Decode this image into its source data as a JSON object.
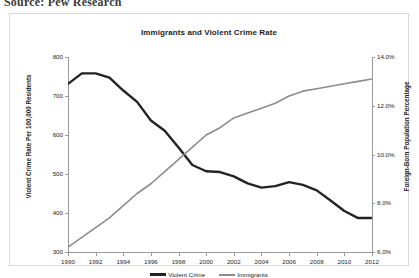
{
  "source_caption": "Source: Pew Research",
  "chart_data": {
    "type": "line",
    "title": "Immigrants and Violent Crime Rate",
    "xlabel": "",
    "ylabel": "Violent Crime Rate Per 100,000 Residents",
    "y2label": "Foreign-Born Population Percentage",
    "grid": false,
    "legend_position": "bottom",
    "x": [
      1990,
      1991,
      1992,
      1993,
      1994,
      1995,
      1996,
      1997,
      1998,
      1999,
      2000,
      2001,
      2002,
      2003,
      2004,
      2005,
      2006,
      2007,
      2008,
      2009,
      2010,
      2011,
      2012
    ],
    "xtick_labels": [
      "1990",
      "1992",
      "1994",
      "1996",
      "1998",
      "2000",
      "2002",
      "2004",
      "2006",
      "2008",
      "2010",
      "2012"
    ],
    "xlim": [
      1990,
      2012
    ],
    "ylim": [
      300,
      800
    ],
    "ytick_labels": [
      "300",
      "400",
      "500",
      "600",
      "700",
      "800"
    ],
    "y2lim": [
      6.0,
      14.0
    ],
    "y2tick_labels": [
      "6.0%",
      "8.0%",
      "10.0%",
      "12.0%",
      "14.0%"
    ],
    "series": [
      {
        "name": "Violent Crime",
        "axis": "left",
        "color": "#232323",
        "unit": "per 100,000 residents",
        "values": [
          731,
          758,
          758,
          747,
          714,
          685,
          637,
          611,
          568,
          523,
          507,
          505,
          494,
          476,
          465,
          469,
          479,
          472,
          458,
          432,
          405,
          387,
          387
        ]
      },
      {
        "name": "Immigrants",
        "axis": "right",
        "color": "#8c8c8c",
        "unit": "percent foreign-born",
        "values": [
          6.2,
          6.6,
          7.0,
          7.4,
          7.9,
          8.4,
          8.8,
          9.3,
          9.8,
          10.3,
          10.8,
          11.1,
          11.5,
          11.7,
          11.9,
          12.1,
          12.4,
          12.6,
          12.7,
          12.8,
          12.9,
          13.0,
          13.1
        ]
      }
    ]
  }
}
